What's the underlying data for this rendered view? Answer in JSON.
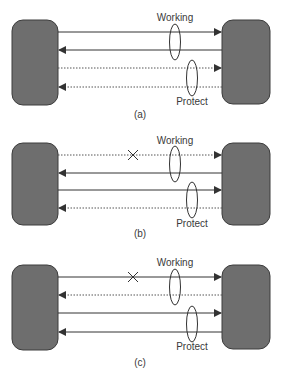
{
  "colors": {
    "node_fill": "#6e6e6e",
    "node_stroke": "#3c3c3c",
    "line": "#333333",
    "background": "#ffffff"
  },
  "panels": [
    {
      "caption": "(a)",
      "working_label": "Working",
      "protect_label": "Protect",
      "links": [
        {
          "direction": "right",
          "style": "solid"
        },
        {
          "direction": "left",
          "style": "solid"
        },
        {
          "direction": "right",
          "style": "dotted"
        },
        {
          "direction": "left",
          "style": "dotted"
        }
      ],
      "failure_marker": false
    },
    {
      "caption": "(b)",
      "working_label": "Working",
      "protect_label": "Protect",
      "links": [
        {
          "direction": "right",
          "style": "dotted"
        },
        {
          "direction": "left",
          "style": "solid"
        },
        {
          "direction": "right",
          "style": "solid"
        },
        {
          "direction": "left",
          "style": "dotted"
        }
      ],
      "failure_marker": true
    },
    {
      "caption": "(c)",
      "working_label": "Working",
      "protect_label": "Protect",
      "links": [
        {
          "direction": "right",
          "style": "solid"
        },
        {
          "direction": "left",
          "style": "dotted"
        },
        {
          "direction": "right",
          "style": "solid"
        },
        {
          "direction": "left",
          "style": "solid"
        }
      ],
      "failure_marker": true
    }
  ],
  "icons": {
    "failure": "x-mark-icon"
  }
}
